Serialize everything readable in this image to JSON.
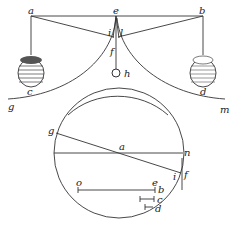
{
  "figure_top": {
    "labels": {
      "a": "a",
      "e": "e",
      "b": "b",
      "i": "i",
      "l": "l",
      "f": "f",
      "h": "h",
      "c": "c",
      "d": "d",
      "g": "g",
      "m": "m"
    }
  },
  "figure_bottom": {
    "labels": {
      "g": "g",
      "a": "a",
      "n": "n",
      "i": "i",
      "f": "f",
      "o": "o",
      "e": "e",
      "b": "b",
      "c": "c",
      "d": "d"
    }
  }
}
